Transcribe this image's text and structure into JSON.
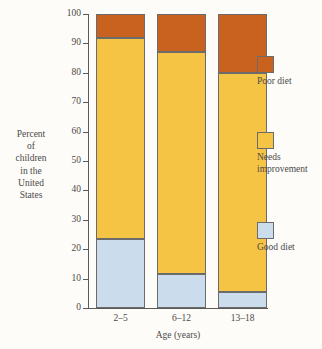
{
  "chart_data": {
    "type": "bar",
    "subtype": "stacked-100-percent",
    "title": "",
    "xlabel": "Age (years)",
    "ylabel": "Percent of children in the United States",
    "ylabel_lines": [
      "Percent",
      "of",
      "children",
      "in the",
      "United",
      "States"
    ],
    "categories": [
      "2–5",
      "6–12",
      "13–18"
    ],
    "ylim": [
      0,
      100
    ],
    "yticks": [
      0,
      10,
      20,
      30,
      40,
      50,
      60,
      70,
      80,
      90,
      100
    ],
    "ytick_labels": [
      "0",
      "10",
      "20",
      "30",
      "40",
      "50",
      "60",
      "70",
      "80",
      "90",
      "100"
    ],
    "grid": false,
    "legend_position": "right",
    "series": [
      {
        "name": "Good diet",
        "color": "#cbdcec",
        "values": [
          23.5,
          11.5,
          5.5
        ]
      },
      {
        "name": "Needs improvement",
        "color": "#f6c445",
        "values": [
          68.5,
          75.5,
          74.5
        ]
      },
      {
        "name": "Poor diet",
        "color": "#c8621e",
        "values": [
          8,
          13,
          20
        ]
      }
    ],
    "cumulative_tops": {
      "good_diet": [
        23.5,
        11.5,
        5.5
      ],
      "needs_improvement": [
        92,
        87,
        80
      ],
      "poor_diet": [
        100,
        100,
        100
      ]
    },
    "legend": [
      {
        "label": "Poor diet",
        "color": "#c8621e"
      },
      {
        "label": "Needs improvement",
        "color": "#f6c445"
      },
      {
        "label": "Good diet",
        "color": "#cbdcec"
      }
    ],
    "colors": {
      "poor_diet": "#c8621e",
      "needs_improvement": "#f6c445",
      "good_diet": "#cbdcec",
      "axis": "#5a5a5a",
      "text": "#4a4a4a",
      "background": "#fdfcf8",
      "bar_outline": "#6b6b6b"
    }
  }
}
